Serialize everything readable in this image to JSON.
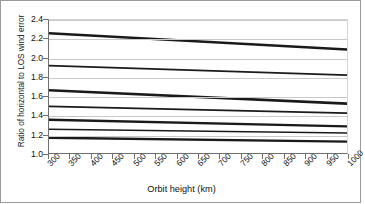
{
  "chart_data": {
    "type": "line",
    "title": "",
    "xlabel": "Orbit height (km)",
    "ylabel": "Ratio of horizontal to LOS wind error",
    "xlim": [
      300,
      1000
    ],
    "ylim": [
      1.0,
      2.4
    ],
    "xticks": [
      300,
      350,
      400,
      450,
      500,
      550,
      600,
      650,
      700,
      750,
      800,
      850,
      900,
      950,
      1000
    ],
    "yticks": [
      "1.0",
      "1.2",
      "1.4",
      "1.6",
      "1.8",
      "2.0",
      "2.2",
      "2.4"
    ],
    "grid": "horizontal",
    "legend": "none",
    "x": [
      300,
      1000
    ],
    "series": [
      {
        "name": "series-1",
        "values": [
          2.26,
          2.09
        ],
        "color": "#1a1a1a",
        "width": 2.6
      },
      {
        "name": "series-2",
        "values": [
          1.92,
          1.82
        ],
        "color": "#1a1a1a",
        "width": 1.7
      },
      {
        "name": "series-3",
        "values": [
          1.66,
          1.52
        ],
        "color": "#1a1a1a",
        "width": 2.6
      },
      {
        "name": "series-4",
        "values": [
          1.49,
          1.42
        ],
        "color": "#1a1a1a",
        "width": 1.7
      },
      {
        "name": "series-5",
        "values": [
          1.35,
          1.28
        ],
        "color": "#1a1a1a",
        "width": 2.4
      },
      {
        "name": "series-6",
        "values": [
          1.25,
          1.21
        ],
        "color": "#1a1a1a",
        "width": 1.6
      },
      {
        "name": "series-7",
        "values": [
          1.16,
          1.12
        ],
        "color": "#1a1a1a",
        "width": 2.4
      }
    ]
  },
  "axis": {
    "x_title": "Orbit height (km)",
    "y_title": "Ratio of horizontal to LOS wind error"
  }
}
